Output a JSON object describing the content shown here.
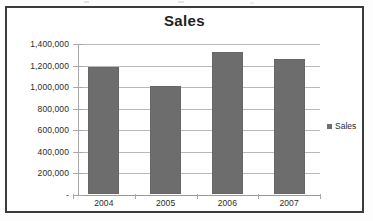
{
  "chart_data": {
    "type": "bar",
    "title": "Sales",
    "xlabel": "",
    "ylabel": "",
    "categories": [
      "2004",
      "2005",
      "2006",
      "2007"
    ],
    "values": [
      1180000,
      1000000,
      1320000,
      1255000
    ],
    "series": [
      {
        "name": "Sales",
        "values": [
          1180000,
          1000000,
          1320000,
          1255000
        ]
      }
    ],
    "ylim": [
      0,
      1400000
    ],
    "ytick_values": [
      0,
      200000,
      400000,
      600000,
      800000,
      1000000,
      1200000,
      1400000
    ],
    "ytick_labels": [
      "-",
      "200,000",
      "400,000",
      "600,000",
      "800,000",
      "1,000,000",
      "1,200,000",
      "1,400,000"
    ],
    "grid": true,
    "legend": {
      "position": "right",
      "entries": [
        {
          "label": "Sales",
          "color": "#6d6d6d",
          "marker": "legend-square-icon"
        }
      ]
    },
    "colors": {
      "bar": "#6d6d6d",
      "gridline": "#b9b9b9",
      "axis": "#a8a8a8",
      "frame": "#3b3b3b",
      "text": "#2b2b2b",
      "background": "#ffffff"
    }
  }
}
